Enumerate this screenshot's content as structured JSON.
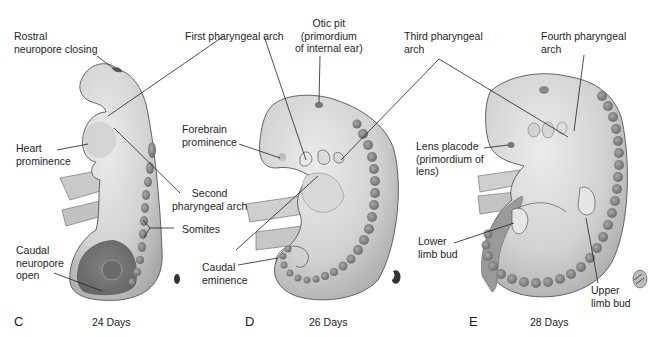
{
  "figure": {
    "panels": [
      {
        "letter": "C",
        "age": "24 Days",
        "labels": {
          "rostral": "Rostral\nneuropore closing",
          "heart": "Heart\nprominence",
          "somites": "Somites",
          "caudal_neuropore": "Caudal\nneuropore\nopen"
        }
      },
      {
        "letter": "D",
        "age": "26 Days",
        "labels": {
          "first_arch": "First pharyngeal arch",
          "otic": "Otic pit\n(primordium\nof internal ear)",
          "forebrain": "Forebrain\nprominence",
          "second_arch": "Second\npharyngeal arch",
          "caudal_eminence": "Caudal\neminence"
        }
      },
      {
        "letter": "E",
        "age": "28 Days",
        "labels": {
          "third_arch": "Third pharyngeal\narch",
          "fourth_arch": "Fourth pharyngeal\narch",
          "lens": "Lens placode\n(primordium of\nlens)",
          "lower_limb": "Lower\nlimb bud",
          "upper_limb": "Upper\nlimb bud"
        }
      }
    ],
    "colors": {
      "body_light": "#e4e4e4",
      "body_mid": "#c8c8c8",
      "body_dark": "#9a9a9a",
      "somite": "#8c8c8c",
      "outline": "#555555",
      "leader": "#222222"
    }
  }
}
